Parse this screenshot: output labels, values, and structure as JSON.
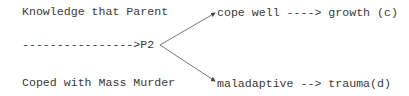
{
  "diagram": {
    "left": {
      "line1": "Knowledge that Parent",
      "arrow": "---------------->P2",
      "line3": "Coped with Mass Murder"
    },
    "branches": [
      {
        "label": "cope well ----> growth (c)"
      },
      {
        "label": "maladaptive --> trauma(d)"
      }
    ]
  }
}
